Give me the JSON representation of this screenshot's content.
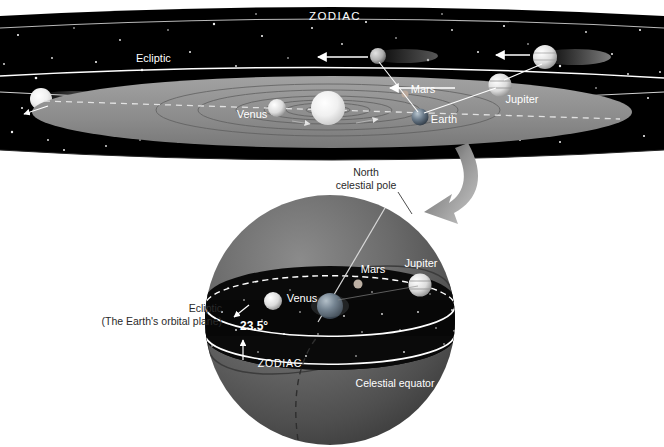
{
  "figure": {
    "colors": {
      "space": "#000000",
      "belt_dark": "#0a0a0a",
      "disk_gray": "#8c8c8c",
      "sphere_gray": "#636363",
      "sphere_dark": "#3f3f3f",
      "line_white": "#ffffff",
      "arrow_gray": "#9a9a9a",
      "label_white": "#ffffff",
      "label_dark": "#2b2b2b",
      "star_white": "#f2f2f2",
      "planet_bright": "#f0f0f0"
    }
  },
  "top_panel": {
    "zodiac_label": "ZODIAC",
    "ecliptic_label": "Ecliptic",
    "planets": [
      {
        "name": "Venus",
        "label": "Venus",
        "label_x": 252,
        "label_y": 114,
        "px": 277,
        "py": 108,
        "r": 9
      },
      {
        "name": "Mars",
        "label": "Mars",
        "label_x": 423,
        "label_y": 89,
        "px": 405,
        "py": 94,
        "r": 4
      },
      {
        "name": "Earth",
        "label": "Earth",
        "label_x": 443,
        "label_y": 120,
        "px": 420,
        "py": 117,
        "r": 8
      },
      {
        "name": "Jupiter",
        "label": "Jupiter",
        "label_x": 522,
        "label_y": 99,
        "px": 500,
        "py": 85,
        "r": 11
      }
    ],
    "sun": {
      "name": "Sun",
      "px": 328,
      "py": 108,
      "r": 17
    },
    "projected": [
      {
        "name": "mars-projection",
        "px": 378,
        "py": 56,
        "r": 8,
        "arrow_from": 368,
        "arrow_to": 318,
        "arrow_y": 57
      },
      {
        "name": "jupiter-projection",
        "px": 545,
        "py": 57,
        "r": 12,
        "arrow_from": 530,
        "arrow_to": 495,
        "arrow_y": 55
      }
    ],
    "edge_planets": [
      {
        "name": "left-edge-planet",
        "px": 41,
        "py": 99,
        "r": 11
      }
    ],
    "inner_arrow": {
      "from_x": 455,
      "to_x": 388,
      "y": 88
    }
  },
  "sphere_panel": {
    "north_pole_label_line1": "North",
    "north_pole_label_line2": "celestial pole",
    "ecliptic_label_line1": "Ecliptic",
    "ecliptic_label_line2": "(The Earth's orbital plane)",
    "tilt_label": "23.5°",
    "zodiac_label": "ZODIAC",
    "celestial_equator_label": "Celestial equator",
    "planets": [
      {
        "name": "Venus",
        "label": "Venus",
        "label_x": 302,
        "label_y": 298,
        "px": 273,
        "py": 301,
        "r": 9
      },
      {
        "name": "Mars",
        "label": "Mars",
        "label_x": 373,
        "label_y": 270,
        "px": 358,
        "py": 283,
        "r": 4
      },
      {
        "name": "Jupiter",
        "label": "Jupiter",
        "label_x": 421,
        "label_y": 264,
        "px": 420,
        "py": 284,
        "r": 11
      },
      {
        "name": "Earth",
        "label": "",
        "px": 330,
        "py": 305,
        "r": 13
      }
    ],
    "center": {
      "cx": 330,
      "cy": 320,
      "r": 125
    }
  },
  "transition_arrow": {
    "name": "curved-transition-arrow"
  }
}
